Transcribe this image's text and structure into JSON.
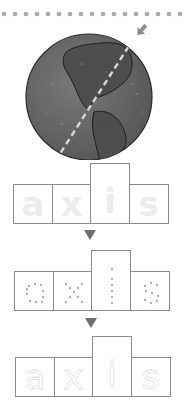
{
  "worksheet": {
    "word": "axis",
    "letters": [
      "a",
      "x",
      "i",
      "s"
    ],
    "rows": [
      {
        "style": "solid-outline",
        "letters": [
          "a",
          "x",
          "i",
          "s"
        ]
      },
      {
        "style": "dotted",
        "letters": [
          "a",
          "x",
          "i",
          "s"
        ]
      },
      {
        "style": "faint",
        "letters": [
          "a",
          "x",
          "i",
          "s"
        ]
      }
    ],
    "illustration": "globe-with-axis-line",
    "colors": {
      "box_border": "#8a8a8a",
      "arrow": "#6e6e6e",
      "dots": "#a8a8a8",
      "globe_ocean": "#6a6a6a",
      "globe_land": "#4e4e4e",
      "axis_line": "#d8d8d8"
    }
  }
}
